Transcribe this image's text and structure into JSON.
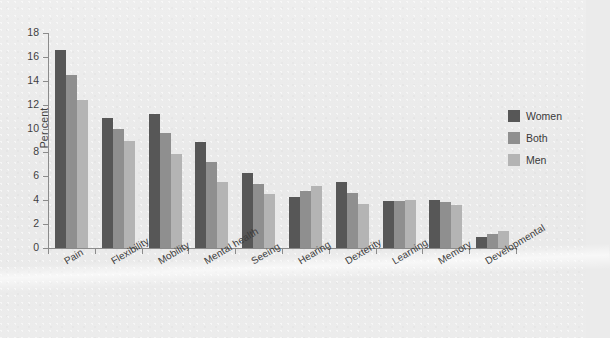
{
  "chart_data": {
    "type": "bar",
    "title": "",
    "xlabel": "",
    "ylabel": "Per cent",
    "ylim": [
      0,
      18
    ],
    "ytick_step": 2,
    "yticks": [
      0,
      2,
      4,
      6,
      8,
      10,
      12,
      14,
      16,
      18
    ],
    "grid": false,
    "legend_position": "right",
    "orientation": "vertical",
    "grouping": "clustered",
    "categories": [
      "Pain",
      "Flexibility",
      "Mobility",
      "Mental health",
      "Seeing",
      "Hearing",
      "Dexterity",
      "Learning",
      "Memory",
      "Developmental"
    ],
    "series": [
      {
        "name": "Women",
        "color": "#575757",
        "values": [
          16.6,
          10.9,
          11.2,
          8.9,
          6.3,
          4.3,
          5.5,
          3.95,
          4.05,
          0.95
        ]
      },
      {
        "name": "Both",
        "color": "#8f8f8f",
        "values": [
          14.5,
          10.0,
          9.6,
          7.2,
          5.4,
          4.8,
          4.6,
          3.95,
          3.85,
          1.2
        ]
      },
      {
        "name": "Men",
        "color": "#b4b4b4",
        "values": [
          12.4,
          9.0,
          7.9,
          5.5,
          4.5,
          5.2,
          3.65,
          4.05,
          3.6,
          1.45
        ]
      }
    ]
  },
  "colors": {
    "page_background": "#ebebeb",
    "axis": "#8b8b8b",
    "text": "#3a3a3a",
    "series_women": "#575757",
    "series_both": "#8f8f8f",
    "series_men": "#b4b4b4"
  }
}
